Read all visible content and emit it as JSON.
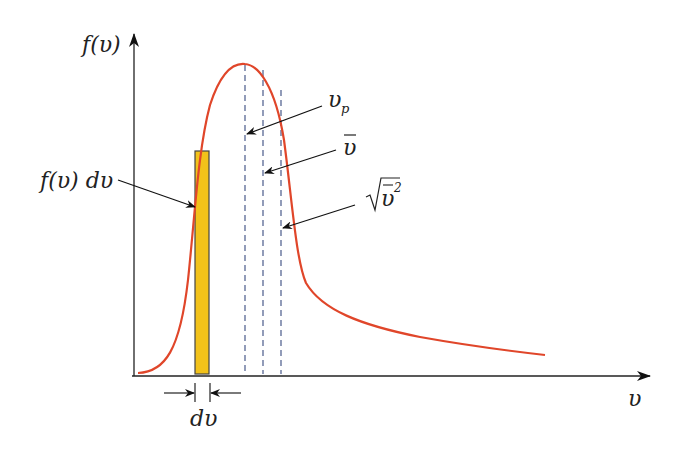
{
  "diagram": {
    "colors": {
      "curve": "#e0462a",
      "bar_fill": "#f2c21a",
      "bar_stroke": "#444444",
      "axis": "#222222",
      "dashed": "#4a5a8a"
    },
    "axes": {
      "y_label": "f(υ)",
      "x_label": "υ"
    },
    "labels": {
      "strip_area": "f(υ) dυ",
      "strip_width": "dυ",
      "most_probable": "υ",
      "most_probable_sub": "p",
      "mean": "υ",
      "rms": "υ",
      "rms_sup": "2"
    },
    "markers": [
      {
        "name": "most-probable-speed",
        "label": "υ_p"
      },
      {
        "name": "mean-speed",
        "label": "ῡ"
      },
      {
        "name": "rms-speed",
        "label": "√(ῡ²)"
      }
    ]
  }
}
